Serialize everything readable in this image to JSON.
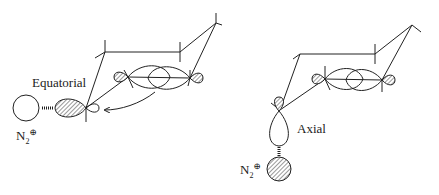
{
  "diagram": {
    "panels": [
      {
        "id": "equatorial",
        "label": "Equatorial",
        "leaving_group": {
          "symbol": "N",
          "subscript": "2",
          "charge": "⊕"
        },
        "arrow": "curved arrow from σ* C–C orbital toward back lobe of C–N bond"
      },
      {
        "id": "axial",
        "label": "Axial",
        "leaving_group": {
          "symbol": "N",
          "subscript": "2",
          "charge": "⊕"
        }
      }
    ],
    "colors": {
      "line": "#222222",
      "hatch": "#555555",
      "background": "#ffffff"
    }
  }
}
